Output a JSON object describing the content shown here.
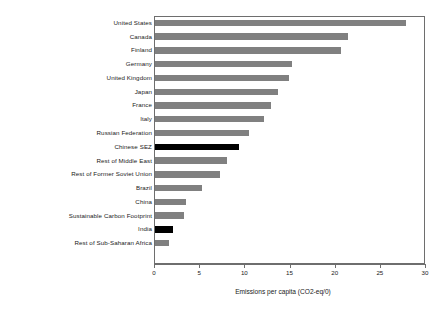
{
  "chart_data": {
    "type": "bar",
    "orientation": "horizontal",
    "title": "",
    "xlabel": "Emissions per capita (CO2-eq/0)",
    "ylabel": "",
    "xlim": [
      0,
      30
    ],
    "xticks": [
      0,
      5,
      10,
      15,
      20,
      25,
      30
    ],
    "grid": false,
    "legend": "none",
    "bar_color": "#808080",
    "highlight_color": "#000000",
    "categories": [
      "United States",
      "Canada",
      "Finland",
      "Germany",
      "United Kingdom",
      "Japan",
      "France",
      "Italy",
      "Russian Federation",
      "Chinese SEZ",
      "Rest of Middle East",
      "Rest of Former Soviet Union",
      "Brazil",
      "China",
      "Sustainable Carbon Footprint",
      "India",
      "Rest of Sub-Saharan Africa"
    ],
    "values": [
      27.8,
      21.4,
      20.6,
      15.2,
      14.8,
      13.6,
      12.8,
      12.1,
      10.4,
      9.3,
      8.0,
      7.2,
      5.2,
      3.4,
      3.2,
      2.0,
      1.6
    ],
    "highlighted": [
      "Chinese SEZ",
      "India"
    ]
  }
}
